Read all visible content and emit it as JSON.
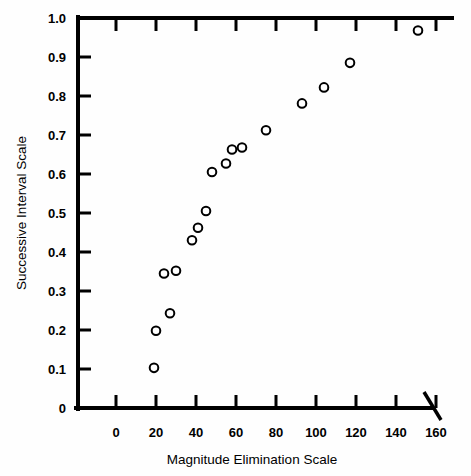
{
  "chart_data": {
    "type": "scatter",
    "title": "",
    "xlabel": "Magnitude Elimination Scale",
    "ylabel": "Successive Interval Scale",
    "xlim": [
      0,
      165
    ],
    "ylim": [
      0,
      1.0
    ],
    "grid": false,
    "legend": null,
    "axis_break": {
      "axis": "x",
      "after_value": 163,
      "note": "diagonal break slash at right end of x-axis"
    },
    "xticks": [
      0,
      20,
      40,
      60,
      80,
      100,
      120,
      140,
      160
    ],
    "xtick_labels": [
      "0",
      "20",
      "40",
      "60",
      "80",
      "100",
      "120",
      "140",
      "160"
    ],
    "yticks": [
      0,
      0.1,
      0.2,
      0.3,
      0.4,
      0.5,
      0.6,
      0.7,
      0.8,
      0.9,
      1.0
    ],
    "ytick_labels": [
      "0",
      "0.1",
      "0.2",
      "0.3",
      "0.4",
      "0.5",
      "0.6",
      "0.7",
      "0.8",
      "0.9",
      "1.0"
    ],
    "marker": "open-circle",
    "marker_color": "#000000",
    "marker_fill": "#ffffff",
    "points": [
      {
        "x": 19,
        "y": 0.103
      },
      {
        "x": 20,
        "y": 0.198
      },
      {
        "x": 24,
        "y": 0.345
      },
      {
        "x": 27,
        "y": 0.243
      },
      {
        "x": 30,
        "y": 0.352
      },
      {
        "x": 38,
        "y": 0.43
      },
      {
        "x": 41,
        "y": 0.462
      },
      {
        "x": 45,
        "y": 0.505
      },
      {
        "x": 48,
        "y": 0.605
      },
      {
        "x": 55,
        "y": 0.627
      },
      {
        "x": 58,
        "y": 0.663
      },
      {
        "x": 63,
        "y": 0.668
      },
      {
        "x": 75,
        "y": 0.712
      },
      {
        "x": 93,
        "y": 0.781
      },
      {
        "x": 104,
        "y": 0.822
      },
      {
        "x": 117,
        "y": 0.885
      },
      {
        "x": 151,
        "y": 0.968
      }
    ],
    "series": [
      {
        "name": "data",
        "x": [
          19,
          20,
          24,
          27,
          30,
          38,
          41,
          45,
          48,
          55,
          58,
          63,
          75,
          93,
          104,
          117,
          151
        ],
        "values": [
          0.103,
          0.198,
          0.345,
          0.243,
          0.352,
          0.43,
          0.462,
          0.505,
          0.605,
          0.627,
          0.663,
          0.668,
          0.712,
          0.781,
          0.822,
          0.885,
          0.968
        ]
      }
    ]
  },
  "colors": {
    "background": "#ffffff",
    "axis": "#000000",
    "marker_stroke": "#000000",
    "marker_fill": "#ffffff"
  }
}
